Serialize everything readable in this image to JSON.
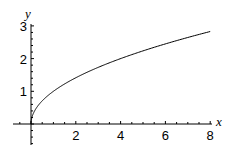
{
  "chart_data": {
    "type": "line",
    "title": "",
    "xlabel": "x",
    "ylabel": "y",
    "xlim": [
      -0.5,
      8
    ],
    "ylim": [
      -0.5,
      3
    ],
    "x_ticks": [
      "2",
      "4",
      "6",
      "8"
    ],
    "y_ticks": [
      "1",
      "2",
      "3"
    ],
    "grid": false,
    "series": [
      {
        "name": "sqrt(x)",
        "x": [
          0,
          0.05,
          0.25,
          0.5,
          1,
          1.5,
          2,
          3,
          4,
          5,
          6,
          7,
          8
        ],
        "y": [
          0,
          0.22,
          0.5,
          0.71,
          1,
          1.22,
          1.41,
          1.73,
          2,
          2.24,
          2.45,
          2.65,
          2.83
        ]
      }
    ]
  }
}
